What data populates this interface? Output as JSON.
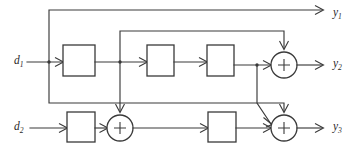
{
  "diagram": {
    "type": "signal-flow-block-diagram",
    "title": "",
    "line_color": "#3a3a3a",
    "background_color": "#ffffff",
    "inputs": [
      {
        "id": "d1",
        "label": "d",
        "subscript": "1",
        "x": 14,
        "y": 62
      },
      {
        "id": "d2",
        "label": "d",
        "subscript": "2",
        "x": 14,
        "y": 128
      }
    ],
    "outputs": [
      {
        "id": "y1",
        "label": "y",
        "subscript": "1",
        "x": 333,
        "y": 14
      },
      {
        "id": "y2",
        "label": "y",
        "subscript": "2",
        "x": 333,
        "y": 65
      },
      {
        "id": "y3",
        "label": "y",
        "subscript": "3",
        "x": 333,
        "y": 128
      }
    ],
    "blocks": [
      {
        "id": "block-1",
        "row": "top",
        "x": 63,
        "y": 45,
        "w": 32,
        "h": 31
      },
      {
        "id": "block-2",
        "row": "top",
        "x": 147,
        "y": 45,
        "w": 27,
        "h": 31
      },
      {
        "id": "block-3",
        "row": "top",
        "x": 207,
        "y": 45,
        "w": 27,
        "h": 31
      },
      {
        "id": "block-4",
        "row": "bottom",
        "x": 67,
        "y": 112,
        "w": 28,
        "h": 30
      },
      {
        "id": "block-5",
        "row": "bottom",
        "x": 208,
        "y": 112,
        "w": 28,
        "h": 30
      }
    ],
    "adders": [
      {
        "id": "adder-1",
        "symbol": "+",
        "cx": 284,
        "cy": 65,
        "r": 13
      },
      {
        "id": "adder-2",
        "symbol": "+",
        "cx": 120,
        "cy": 128,
        "r": 13
      },
      {
        "id": "adder-3",
        "symbol": "+",
        "cx": 284,
        "cy": 128,
        "r": 13
      }
    ],
    "junctions": [
      {
        "id": "junction-d1-tap",
        "x": 49,
        "y": 62
      },
      {
        "id": "junction-mid-tap",
        "x": 120,
        "y": 62
      },
      {
        "id": "junction-block3-tap",
        "x": 257,
        "y": 65
      }
    ],
    "feedback_paths": [
      {
        "id": "path-y1-top",
        "from": "junction-d1-tap",
        "to": "y1",
        "corner_y": 10
      },
      {
        "id": "path-mid-to-adder1",
        "from": "junction-mid-tap",
        "to": "adder-1",
        "corner_y": 31
      },
      {
        "id": "path-d1tap-to-adder3",
        "from": "junction-d1-tap",
        "to": "adder-3",
        "corner_y": 103
      },
      {
        "id": "path-block3tap-to-adder3",
        "from": "junction-block3-tap",
        "to": "adder-3",
        "corner_y": 103
      },
      {
        "id": "path-mid-to-adder2",
        "from": "junction-mid-tap",
        "to": "adder-2"
      }
    ]
  }
}
